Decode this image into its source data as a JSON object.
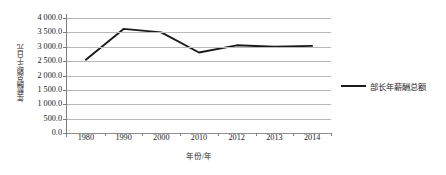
{
  "chart_data": {
    "type": "line",
    "title": "",
    "xlabel": "年份/年",
    "ylabel": "年薪酬总额/千日元",
    "categories": [
      "1980",
      "1990",
      "2000",
      "2010",
      "2012",
      "2013",
      "2014"
    ],
    "series": [
      {
        "name": "部长年薪酬总额",
        "values": [
          2550,
          3620,
          3500,
          2800,
          3050,
          3000,
          3030
        ],
        "color": "#1a1a1a"
      }
    ],
    "ylim": [
      0,
      4000
    ],
    "yticks": [
      0,
      500,
      1000,
      1500,
      2000,
      2500,
      3000,
      3500,
      4000
    ],
    "ytick_labels": [
      "0.0",
      "500.0",
      "1 000.0",
      "1 500.0",
      "2 000.0",
      "2 500.0",
      "3 000.0",
      "3 500.0",
      "4 000.0"
    ],
    "grid": true,
    "legend_position": "right",
    "gridline_color": "#b9b9b9",
    "axis_color": "#7d7d7d"
  },
  "legend": {
    "entries": [
      {
        "label": "部长年薪酬总额",
        "swatch_name": "legend-swatch-line"
      }
    ]
  }
}
